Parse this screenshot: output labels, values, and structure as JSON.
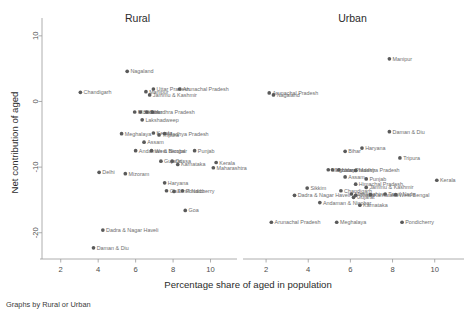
{
  "figure": {
    "note": "Graphs by Rural or Urban",
    "xlabel": "Percentage share of aged in population",
    "ylabel": "Net contribution of aged"
  },
  "chart_data": {
    "type": "scatter",
    "title": "",
    "xlabel": "Percentage share of aged in population",
    "ylabel": "Net contribution of aged",
    "note": "Graphs by Rural or Urban",
    "xlim": [
      1.0,
      11.2
    ],
    "ylim": [
      -24.0,
      11.5
    ],
    "xticks": [
      2,
      4,
      6,
      8,
      10
    ],
    "yticks": [
      10,
      0,
      -10,
      -20
    ],
    "ytick_labels": [
      "10",
      "0",
      "-10",
      "-20"
    ],
    "grid": false,
    "legend": "none",
    "marker_color": "#5a5a5a",
    "label_color": "#6e6e6e",
    "panels": [
      {
        "name": "Rural",
        "points": [
          {
            "label": "Nagaland",
            "x": 5.55,
            "y": 4.6
          },
          {
            "label": "Chandigarh",
            "x": 3.05,
            "y": 1.4
          },
          {
            "label": "Manipur",
            "x": 6.55,
            "y": 1.5
          },
          {
            "label": "Uttar Pradesh",
            "x": 6.95,
            "y": 1.9
          },
          {
            "label": "Arunachal Pradesh",
            "x": 8.35,
            "y": 1.9
          },
          {
            "label": "Jammu & Kashmir",
            "x": 6.75,
            "y": 1.0
          },
          {
            "label": "Mizoram",
            "x": 5.95,
            "y": -1.6
          },
          {
            "label": "Sikkim",
            "x": 6.25,
            "y": -1.6
          },
          {
            "label": "Bihar",
            "x": 6.6,
            "y": -1.6
          },
          {
            "label": "Andhra Pradesh",
            "x": 6.9,
            "y": -1.6
          },
          {
            "label": "Lakshadweep",
            "x": 6.35,
            "y": -2.8
          },
          {
            "label": "Meghalaya",
            "x": 5.25,
            "y": -4.9
          },
          {
            "label": "Kerala",
            "x": 6.95,
            "y": -4.8
          },
          {
            "label": "Tripura",
            "x": 7.25,
            "y": -5.1
          },
          {
            "label": "Madhya Pradesh",
            "x": 7.55,
            "y": -4.9
          },
          {
            "label": "Assam",
            "x": 6.45,
            "y": -6.2
          },
          {
            "label": "Andaman & Nicobar",
            "x": 6.0,
            "y": -7.5
          },
          {
            "label": "West Bengal",
            "x": 6.85,
            "y": -7.5
          },
          {
            "label": "Punjab",
            "x": 9.15,
            "y": -7.5
          },
          {
            "label": "Gujarat",
            "x": 7.35,
            "y": -9.1
          },
          {
            "label": "Orissa",
            "x": 7.95,
            "y": -9.1
          },
          {
            "label": "Karnataka",
            "x": 8.25,
            "y": -9.6
          },
          {
            "label": "Kerala",
            "x": 10.3,
            "y": -9.3
          },
          {
            "label": "Maharashtra",
            "x": 10.15,
            "y": -10.1
          },
          {
            "label": "Delhi",
            "x": 4.05,
            "y": -10.8
          },
          {
            "label": "Mizoram",
            "x": 5.45,
            "y": -11.0
          },
          {
            "label": "Haryana",
            "x": 7.55,
            "y": -12.4
          },
          {
            "label": "Goa",
            "x": 7.65,
            "y": -13.6
          },
          {
            "label": "Tamil Nadu",
            "x": 8.05,
            "y": -13.7
          },
          {
            "label": "Pondicherry",
            "x": 8.5,
            "y": -13.6
          },
          {
            "label": "Goa",
            "x": 8.65,
            "y": -16.6
          },
          {
            "label": "Dadra & Nagar Haveli",
            "x": 4.25,
            "y": -19.6
          },
          {
            "label": "Daman & Diu",
            "x": 3.75,
            "y": -22.3
          }
        ]
      },
      {
        "name": "Urban",
        "points": [
          {
            "label": "Manipur",
            "x": 7.85,
            "y": 6.5
          },
          {
            "label": "Arunachal Pradesh",
            "x": 2.15,
            "y": 1.3
          },
          {
            "label": "Nagaland",
            "x": 2.35,
            "y": 1.0
          },
          {
            "label": "Daman & Diu",
            "x": 7.85,
            "y": -4.6
          },
          {
            "label": "Haryana",
            "x": 6.55,
            "y": -7.1
          },
          {
            "label": "Bihar",
            "x": 5.75,
            "y": -7.6
          },
          {
            "label": "Tripura",
            "x": 8.35,
            "y": -8.6
          },
          {
            "label": "Meghalaya",
            "x": 4.95,
            "y": -10.4
          },
          {
            "label": "Mizoram",
            "x": 5.15,
            "y": -10.4
          },
          {
            "label": "Uttar Pradesh",
            "x": 5.45,
            "y": -10.4
          },
          {
            "label": "Madhya Pradesh",
            "x": 6.25,
            "y": -10.5
          },
          {
            "label": "Assam",
            "x": 5.75,
            "y": -11.5
          },
          {
            "label": "Punjab",
            "x": 6.75,
            "y": -11.8
          },
          {
            "label": "Himachal Pradesh",
            "x": 6.25,
            "y": -12.6
          },
          {
            "label": "Jammu & Kashmir",
            "x": 6.75,
            "y": -13.1
          },
          {
            "label": "Kerala",
            "x": 10.1,
            "y": -12.0
          },
          {
            "label": "Sikkim",
            "x": 3.95,
            "y": -13.2
          },
          {
            "label": "Chandigarh",
            "x": 5.55,
            "y": -13.6
          },
          {
            "label": "Maharashtra",
            "x": 6.05,
            "y": -14.1
          },
          {
            "label": "Orissa",
            "x": 6.25,
            "y": -14.3
          },
          {
            "label": "Gujarat",
            "x": 6.15,
            "y": -14.6
          },
          {
            "label": "Karnataka",
            "x": 6.95,
            "y": -14.2
          },
          {
            "label": "Tamil Nadu",
            "x": 7.65,
            "y": -14.1
          },
          {
            "label": "West Bengal",
            "x": 8.15,
            "y": -14.2
          },
          {
            "label": "Dadra & Nagar Haveli",
            "x": 3.35,
            "y": -14.3
          },
          {
            "label": "Andaman & Nicobar",
            "x": 4.55,
            "y": -15.4
          },
          {
            "label": "Karnataka",
            "x": 6.45,
            "y": -15.8
          },
          {
            "label": "Arunachal Pradesh",
            "x": 2.25,
            "y": -18.4
          },
          {
            "label": "Meghalaya",
            "x": 5.35,
            "y": -18.4
          },
          {
            "label": "Pondicherry",
            "x": 8.45,
            "y": -18.4
          }
        ]
      }
    ]
  }
}
